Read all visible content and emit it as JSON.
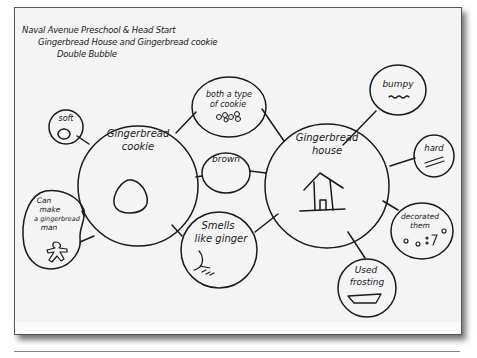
{
  "header": {
    "line1": "Naval Avenue Preschool & Head Start",
    "line2": "Gingerbread House and Gingerbread cookie",
    "line3": "Double Bubble"
  },
  "diagram": {
    "type": "double-bubble-map",
    "left_topic": {
      "line1": "Gingerbread",
      "line2": "cookie",
      "sketch": "round-cookie-icon"
    },
    "right_topic": {
      "line1": "Gingerbread",
      "line2": "house",
      "sketch": "house-icon"
    },
    "shared": [
      {
        "lines": [
          "both a type",
          "of cookie"
        ],
        "sketch": "cookies-icon"
      },
      {
        "lines": [
          "brown"
        ],
        "sketch": ""
      },
      {
        "lines": [
          "Smells",
          "like ginger"
        ],
        "sketch": "ginger-root-icon"
      }
    ],
    "left_only": [
      {
        "lines": [
          "soft"
        ],
        "sketch": "soft-blob-icon"
      },
      {
        "lines": [
          "Can",
          "make",
          "a gingerbread",
          "man"
        ],
        "sketch": "gingerbread-man-icon"
      }
    ],
    "right_only": [
      {
        "lines": [
          "bumpy"
        ],
        "sketch": "wavy-line-icon"
      },
      {
        "lines": [
          "hard"
        ],
        "sketch": "double-line-icon"
      },
      {
        "lines": [
          "decorated",
          "them"
        ],
        "sketch": "decorations-icon"
      },
      {
        "lines": [
          "Used",
          "frosting"
        ],
        "sketch": "frosting-tray-icon"
      }
    ]
  },
  "colors": {
    "ink": "#1a1a1a",
    "paper": "#f4f4f4",
    "border": "#555555"
  }
}
